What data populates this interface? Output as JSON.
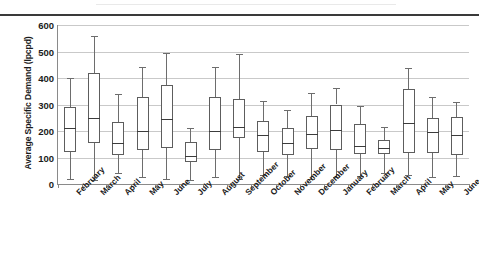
{
  "chart_data": {
    "type": "box",
    "title": "",
    "xlabel": "",
    "ylabel": "Average Specific Demand (lpcpd)",
    "ylim": [
      0,
      600
    ],
    "yticks": [
      0,
      100,
      200,
      300,
      400,
      500,
      600
    ],
    "grid": true,
    "legend": "none",
    "categories": [
      "February",
      "March",
      "April",
      "May",
      "June",
      "July",
      "August",
      "September",
      "October",
      "November",
      "December",
      "January",
      "February",
      "March",
      "April",
      "May",
      "June"
    ],
    "boxes": [
      {
        "category": "February",
        "min": 18,
        "q1": 120,
        "median": 213,
        "q3": 292,
        "max": 400
      },
      {
        "category": "March",
        "min": 15,
        "q1": 155,
        "median": 250,
        "q3": 418,
        "max": 560
      },
      {
        "category": "April",
        "min": 40,
        "q1": 110,
        "median": 155,
        "q3": 235,
        "max": 340
      },
      {
        "category": "May",
        "min": 25,
        "q1": 130,
        "median": 200,
        "q3": 328,
        "max": 440
      },
      {
        "category": "June",
        "min": 20,
        "q1": 135,
        "median": 245,
        "q3": 375,
        "max": 495
      },
      {
        "category": "July",
        "min": 15,
        "q1": 82,
        "median": 105,
        "q3": 160,
        "max": 213
      },
      {
        "category": "August",
        "min": 25,
        "q1": 128,
        "median": 200,
        "q3": 330,
        "max": 440
      },
      {
        "category": "September",
        "min": 20,
        "q1": 172,
        "median": 215,
        "q3": 322,
        "max": 490
      },
      {
        "category": "October",
        "min": 35,
        "q1": 120,
        "median": 185,
        "q3": 238,
        "max": 315
      },
      {
        "category": "November",
        "min": 30,
        "q1": 110,
        "median": 153,
        "q3": 212,
        "max": 278
      },
      {
        "category": "December",
        "min": 18,
        "q1": 132,
        "median": 190,
        "q3": 255,
        "max": 345
      },
      {
        "category": "January",
        "min": 25,
        "q1": 130,
        "median": 205,
        "q3": 300,
        "max": 362
      },
      {
        "category": "February",
        "min": 30,
        "q1": 115,
        "median": 145,
        "q3": 225,
        "max": 293
      },
      {
        "category": "March",
        "min": 40,
        "q1": 115,
        "median": 135,
        "q3": 165,
        "max": 215
      },
      {
        "category": "April",
        "min": 35,
        "q1": 118,
        "median": 232,
        "q3": 360,
        "max": 438
      },
      {
        "category": "May",
        "min": 25,
        "q1": 118,
        "median": 195,
        "q3": 250,
        "max": 328
      },
      {
        "category": "June",
        "min": 30,
        "q1": 110,
        "median": 185,
        "q3": 252,
        "max": 310
      }
    ],
    "colors": {
      "box_stroke": "#5d5d5d",
      "median_stroke": "#3c3c3c",
      "whisker_stroke": "#6d6d6d",
      "gridline": "#c9c9c9",
      "axis": "#8a8a8a",
      "text": "#1b1b1b",
      "background": "#ffffff"
    }
  }
}
